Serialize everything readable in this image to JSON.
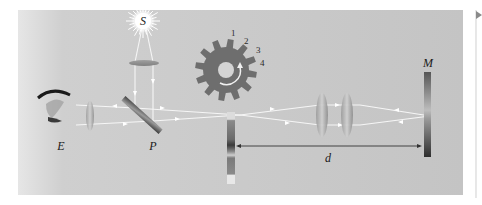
{
  "diagram": {
    "labels": {
      "source": "S",
      "eye": "E",
      "plate": "P",
      "mirror": "M",
      "distance": "d"
    },
    "wheel_teeth_numbers": [
      "1",
      "2",
      "3",
      "4"
    ],
    "colors": {
      "panel": "#c6c6c6",
      "wheel": "#6e6e6e",
      "ray": "#f4f4f4",
      "distance_line": "#333333",
      "page_background": "#ffffff"
    }
  }
}
